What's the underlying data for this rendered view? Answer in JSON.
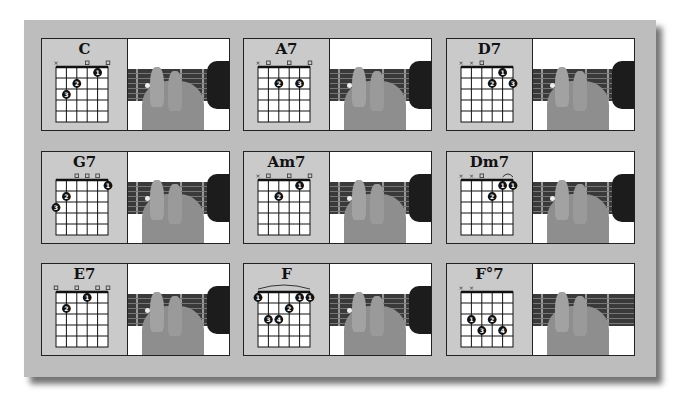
{
  "sheet": {
    "background": "#bdbdbd"
  },
  "chords": [
    {
      "name": "C",
      "markers": [
        "x",
        "",
        "",
        "o",
        "",
        "o"
      ],
      "fingers": [
        {
          "string": 5,
          "fret": 3,
          "label": "3"
        },
        {
          "string": 4,
          "fret": 2,
          "label": "2"
        },
        {
          "string": 2,
          "fret": 1,
          "label": "1"
        }
      ],
      "barre": false
    },
    {
      "name": "A7",
      "markers": [
        "x",
        "o",
        "",
        "o",
        "",
        "o"
      ],
      "fingers": [
        {
          "string": 4,
          "fret": 2,
          "label": "2"
        },
        {
          "string": 2,
          "fret": 2,
          "label": "3"
        }
      ],
      "barre": false
    },
    {
      "name": "D7",
      "markers": [
        "x",
        "x",
        "o",
        "",
        "",
        ""
      ],
      "fingers": [
        {
          "string": 3,
          "fret": 2,
          "label": "2"
        },
        {
          "string": 2,
          "fret": 1,
          "label": "1"
        },
        {
          "string": 1,
          "fret": 2,
          "label": "3"
        }
      ],
      "barre": false
    },
    {
      "name": "G7",
      "markers": [
        "",
        "",
        "o",
        "o",
        "o",
        ""
      ],
      "fingers": [
        {
          "string": 6,
          "fret": 3,
          "label": "3"
        },
        {
          "string": 5,
          "fret": 2,
          "label": "2"
        },
        {
          "string": 1,
          "fret": 1,
          "label": "1"
        }
      ],
      "barre": false
    },
    {
      "name": "Am7",
      "markers": [
        "x",
        "o",
        "",
        "o",
        "",
        "o"
      ],
      "fingers": [
        {
          "string": 4,
          "fret": 2,
          "label": "2"
        },
        {
          "string": 2,
          "fret": 1,
          "label": "1"
        }
      ],
      "barre": false
    },
    {
      "name": "Dm7",
      "markers": [
        "x",
        "x",
        "o",
        "",
        "",
        ""
      ],
      "fingers": [
        {
          "string": 3,
          "fret": 2,
          "label": "2"
        },
        {
          "string": 2,
          "fret": 1,
          "label": "1"
        },
        {
          "string": 1,
          "fret": 1,
          "label": "1"
        }
      ],
      "barre": true
    },
    {
      "name": "E7",
      "markers": [
        "o",
        "",
        "o",
        "",
        "o",
        "o"
      ],
      "fingers": [
        {
          "string": 5,
          "fret": 2,
          "label": "2"
        },
        {
          "string": 3,
          "fret": 1,
          "label": "1"
        }
      ],
      "barre": false
    },
    {
      "name": "F",
      "markers": [
        "",
        "",
        "",
        "",
        "",
        ""
      ],
      "fingers": [
        {
          "string": 6,
          "fret": 1,
          "label": "1"
        },
        {
          "string": 5,
          "fret": 3,
          "label": "3"
        },
        {
          "string": 4,
          "fret": 3,
          "label": "4"
        },
        {
          "string": 3,
          "fret": 2,
          "label": "2"
        },
        {
          "string": 2,
          "fret": 1,
          "label": "1"
        },
        {
          "string": 1,
          "fret": 1,
          "label": "1"
        }
      ],
      "barre": true
    },
    {
      "name": "F°7",
      "markers": [
        "x",
        "x",
        "",
        "",
        "",
        ""
      ],
      "fingers": [
        {
          "string": 5,
          "fret": 3,
          "label": "1"
        },
        {
          "string": 4,
          "fret": 4,
          "label": "3"
        },
        {
          "string": 3,
          "fret": 3,
          "label": "2"
        },
        {
          "string": 2,
          "fret": 4,
          "label": "4"
        }
      ],
      "barre": false
    }
  ]
}
